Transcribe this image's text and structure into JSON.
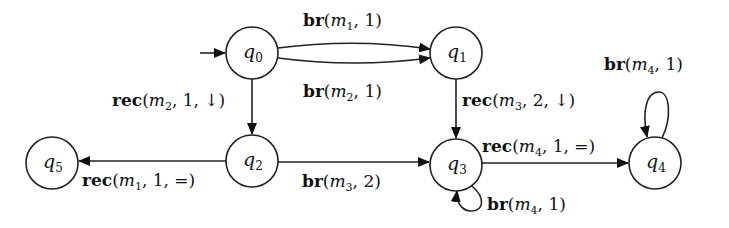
{
  "diagram": {
    "type": "state-machine",
    "initial_state": "q0",
    "nodes": [
      {
        "id": "q0",
        "name": "q",
        "sub": "0",
        "x": 252,
        "y": 53
      },
      {
        "id": "q1",
        "name": "q",
        "sub": "1",
        "x": 456,
        "y": 53
      },
      {
        "id": "q2",
        "name": "q",
        "sub": "2",
        "x": 252,
        "y": 161
      },
      {
        "id": "q3",
        "name": "q",
        "sub": "3",
        "x": 456,
        "y": 165
      },
      {
        "id": "q4",
        "name": "q",
        "sub": "4",
        "x": 655,
        "y": 163
      },
      {
        "id": "q5",
        "name": "q",
        "sub": "5",
        "x": 52,
        "y": 163
      }
    ],
    "edges": [
      {
        "from": "q0",
        "to": "q1",
        "op": "br",
        "msg": "m",
        "msg_sub": "1",
        "args": ", 1)",
        "label_text": "br(m1, 1)"
      },
      {
        "from": "q0",
        "to": "q1",
        "op": "br",
        "msg": "m",
        "msg_sub": "2",
        "args": ", 1)",
        "label_text": "br(m2, 1)"
      },
      {
        "from": "q0",
        "to": "q2",
        "op": "rec",
        "msg": "m",
        "msg_sub": "2",
        "args": ", 1, ↓)",
        "label_text": "rec(m2, 1, ↓)"
      },
      {
        "from": "q1",
        "to": "q3",
        "op": "rec",
        "msg": "m",
        "msg_sub": "3",
        "args": ", 2, ↓)",
        "label_text": "rec(m3, 2, ↓)"
      },
      {
        "from": "q2",
        "to": "q5",
        "op": "rec",
        "msg": "m",
        "msg_sub": "1",
        "args": ", 1, =)",
        "label_text": "rec(m1, 1, =)"
      },
      {
        "from": "q2",
        "to": "q3",
        "op": "br",
        "msg": "m",
        "msg_sub": "3",
        "args": ", 2)",
        "label_text": "br(m3, 2)"
      },
      {
        "from": "q3",
        "to": "q4",
        "op": "rec",
        "msg": "m",
        "msg_sub": "4",
        "args": ", 1, =)",
        "label_text": "rec(m4, 1, =)"
      },
      {
        "from": "q3",
        "to": "q3",
        "op": "br",
        "msg": "m",
        "msg_sub": "4",
        "args": ", 1)",
        "label_text": "br(m4, 1)"
      },
      {
        "from": "q4",
        "to": "q4",
        "op": "br",
        "msg": "m",
        "msg_sub": "4",
        "args": ", 1)",
        "label_text": "br(m4, 1)"
      }
    ]
  }
}
